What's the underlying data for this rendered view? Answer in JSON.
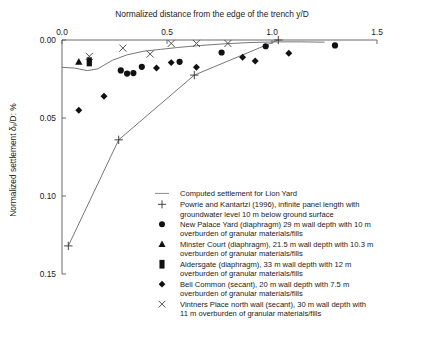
{
  "chart_data": {
    "type": "scatter",
    "title": "",
    "xlabel": "Normalized distance from the edge of the trench y/D",
    "ylabel": "Normalized settlement δᵥ/D: %",
    "xlim": [
      0.0,
      1.5
    ],
    "ylim": [
      0.15,
      0.0
    ],
    "y_axis_inverted": true,
    "grid": false,
    "xticks": [
      0.0,
      0.5,
      1.0,
      1.5
    ],
    "xtick_labels": [
      "0.0",
      "0.5",
      "1.0",
      "1.5"
    ],
    "yticks": [
      0.0,
      0.05,
      0.1,
      0.15
    ],
    "ytick_labels": [
      "0.00",
      "0.05",
      "0.10",
      "0.15"
    ],
    "x_axis_position": "top",
    "legend_position": "inside-lower-right",
    "series": [
      {
        "name": "Computed settlement for Lion Yard",
        "marker": "line",
        "type": "line",
        "points": [
          [
            0.0,
            0.0175
          ],
          [
            0.06,
            0.018
          ],
          [
            0.12,
            0.0196
          ],
          [
            0.17,
            0.0185
          ],
          [
            0.24,
            0.013
          ],
          [
            0.31,
            0.0095
          ],
          [
            0.39,
            0.0072
          ],
          [
            0.47,
            0.006
          ],
          [
            0.55,
            0.0048
          ],
          [
            0.66,
            0.0035
          ],
          [
            0.78,
            0.0024
          ],
          [
            0.9,
            0.0016
          ],
          [
            1.02,
            0.0012
          ],
          [
            1.14,
            0.0012
          ],
          [
            1.25,
            0.0014
          ]
        ]
      },
      {
        "name": "Powrie and Kantartzi (1996), infinite panel length with groundwater level 10 m below ground surface",
        "marker": "plus",
        "type": "line",
        "points": [
          [
            0.03,
            0.132
          ],
          [
            0.27,
            0.064
          ],
          [
            0.63,
            0.0225
          ],
          [
            1.03,
            0.0
          ]
        ]
      },
      {
        "name": "New Palace Yard (diaphragm) 29 m wall depth with 10 m overburden of granular materials/fills",
        "marker": "circle",
        "type": "scatter",
        "points": [
          [
            0.28,
            0.0195
          ],
          [
            0.31,
            0.0215
          ],
          [
            0.34,
            0.0212
          ],
          [
            0.38,
            0.0172
          ],
          [
            0.56,
            0.014
          ],
          [
            0.76,
            0.008
          ],
          [
            0.97,
            0.004
          ],
          [
            1.3,
            0.0035
          ]
        ]
      },
      {
        "name": "Minster Court (diaphragm), 21.5 m wall depth with 10.3 m overburden of granular materials/fills",
        "marker": "triangle",
        "type": "scatter",
        "points": [
          [
            0.08,
            0.014
          ]
        ]
      },
      {
        "name": "Aldersgate (diaphragm), 33 m wall depth with 12 m overburden of granular materials/fills",
        "marker": "square",
        "type": "scatter",
        "points": [
          [
            0.13,
            0.014
          ]
        ]
      },
      {
        "name": "Bell Common (secant), 20 m wall depth with 7.5 m overburden of granular materials/fills",
        "marker": "diamond",
        "type": "scatter",
        "points": [
          [
            0.08,
            0.045
          ],
          [
            0.2,
            0.036
          ],
          [
            0.45,
            0.018
          ],
          [
            0.52,
            0.0145
          ],
          [
            0.64,
            0.0175
          ],
          [
            0.86,
            0.011
          ],
          [
            0.92,
            0.0135
          ],
          [
            1.08,
            0.0085
          ]
        ]
      },
      {
        "name": "Vintners Place north wall (secant), 30 m wall depth with 11 m overburden of granular materials/fills",
        "marker": "x",
        "type": "scatter",
        "points": [
          [
            0.13,
            0.0105
          ],
          [
            0.29,
            0.0052
          ],
          [
            0.42,
            0.009
          ],
          [
            0.52,
            0.0022
          ],
          [
            0.64,
            0.0022
          ],
          [
            0.79,
            0.0022
          ]
        ]
      }
    ]
  },
  "legend": {
    "entries": [
      {
        "marker": "line",
        "label": "Computed settlement for Lion Yard"
      },
      {
        "marker": "plus",
        "label": "Powrie and Kantartzi (1996), infinite panel length with",
        "label2": "groundwater level 10 m below ground surface"
      },
      {
        "marker": "circle",
        "label": "New Palace Yard (diaphragm) 29 m wall depth with 10 m",
        "label2": "overburden of granular materials/fills"
      },
      {
        "marker": "triangle",
        "label": "Minster Court (diaphragm), 21.5 m wall depth with 10.3 m",
        "label2": "overburden of granular materials/fills"
      },
      {
        "marker": "square",
        "label": "Aldersgate (diaphragm), 33 m wall depth with 12 m",
        "label2": "overburden of granular materials/fills"
      },
      {
        "marker": "diamond",
        "label": "Bell Common (secant), 20 m wall depth with 7.5 m",
        "label2": "overburden of granular materials/fills"
      },
      {
        "marker": "x",
        "label": "Vintners Place north wall (secant), 30 m wall depth with",
        "label2": "11 m overburden of granular materials/fills"
      }
    ]
  },
  "colors": {
    "axis": "#58595b",
    "curve": "#6e6f72",
    "marker": "#111111",
    "text": "#1a1a1a",
    "background": "#ffffff"
  }
}
